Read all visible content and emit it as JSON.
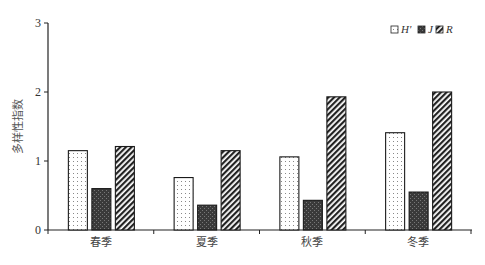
{
  "chart_data": {
    "type": "bar",
    "title": "",
    "xlabel": "",
    "ylabel": "多样性指数",
    "ylim": [
      0,
      3
    ],
    "yticks": [
      0,
      1,
      2,
      3
    ],
    "grid": false,
    "legend_position": "top-right",
    "categories": [
      "春季",
      "夏季",
      "秋季",
      "冬季"
    ],
    "series": [
      {
        "name": "H'",
        "pattern": "dots-light",
        "values": [
          1.15,
          0.76,
          1.06,
          1.41
        ]
      },
      {
        "name": "J",
        "pattern": "dark-grid",
        "values": [
          0.6,
          0.36,
          0.43,
          0.55
        ]
      },
      {
        "name": "R",
        "pattern": "diagonal-hatch",
        "values": [
          1.21,
          1.15,
          1.93,
          2.0
        ]
      }
    ]
  },
  "legend": {
    "items": [
      {
        "label": "H'"
      },
      {
        "label": "J"
      },
      {
        "label": "R"
      }
    ]
  },
  "axis": {
    "y_label": "多样性指数",
    "y_ticks": [
      "0",
      "1",
      "2",
      "3"
    ],
    "x_categories": [
      "春季",
      "夏季",
      "秋季",
      "冬季"
    ]
  }
}
